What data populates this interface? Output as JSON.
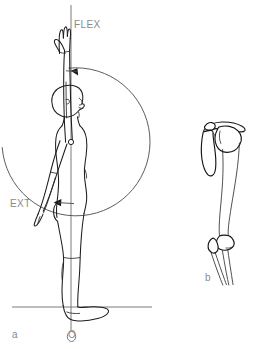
{
  "figure": {
    "background_color": "#ffffff",
    "width": 260,
    "height": 349
  },
  "labels": {
    "flex": "FLEX",
    "ext": "EXT",
    "origin": "O",
    "panel_a": "a",
    "panel_b": "b"
  },
  "colors": {
    "outline": "#1d1d1d",
    "bone": "#161616",
    "arc": "#4a4a4a",
    "reference_line": "#6b6b6b",
    "text": "#8a8a8a",
    "arrow": "#1a1a1a"
  },
  "panels": [
    {
      "id": "a",
      "label": "a",
      "caption": "a",
      "kind": "body-outline-lateral",
      "description": "Lateral view of standing human figure with one arm in full flexion overhead and the opposite arm in extension behind the trunk",
      "annotations": [
        {
          "name": "flex",
          "text": "FLEX",
          "x": 74,
          "y": 27,
          "direction": "up"
        },
        {
          "name": "ext",
          "text": "EXT",
          "x": 10,
          "y": 204,
          "direction": "back"
        },
        {
          "name": "origin",
          "text": "O",
          "x": 68,
          "y": 336,
          "direction": "ground"
        }
      ],
      "pivot": {
        "x": 71,
        "y": 142
      },
      "reference_line": {
        "x": 71,
        "y1": 5,
        "y2": 330
      },
      "ground_line": {
        "y": 307,
        "x1": 12,
        "x2": 152
      },
      "arc": {
        "center_x": 71,
        "center_y": 142,
        "radius": 74,
        "start_deg": -92,
        "end_deg": 176
      }
    },
    {
      "id": "b",
      "label": "b",
      "caption": "b",
      "kind": "skeletal-shoulder-humerus",
      "description": "Skeletal lateral view showing scapula, clavicle, head of humerus, humeral shaft and the proximal radius and ulna at the elbow",
      "bones": [
        "scapula",
        "clavicle",
        "humeral head",
        "humerus shaft",
        "radius",
        "ulna"
      ],
      "annotations": [
        {
          "name": "panel-b-label",
          "text": "b",
          "x": 206,
          "y": 278
        }
      ]
    }
  ]
}
